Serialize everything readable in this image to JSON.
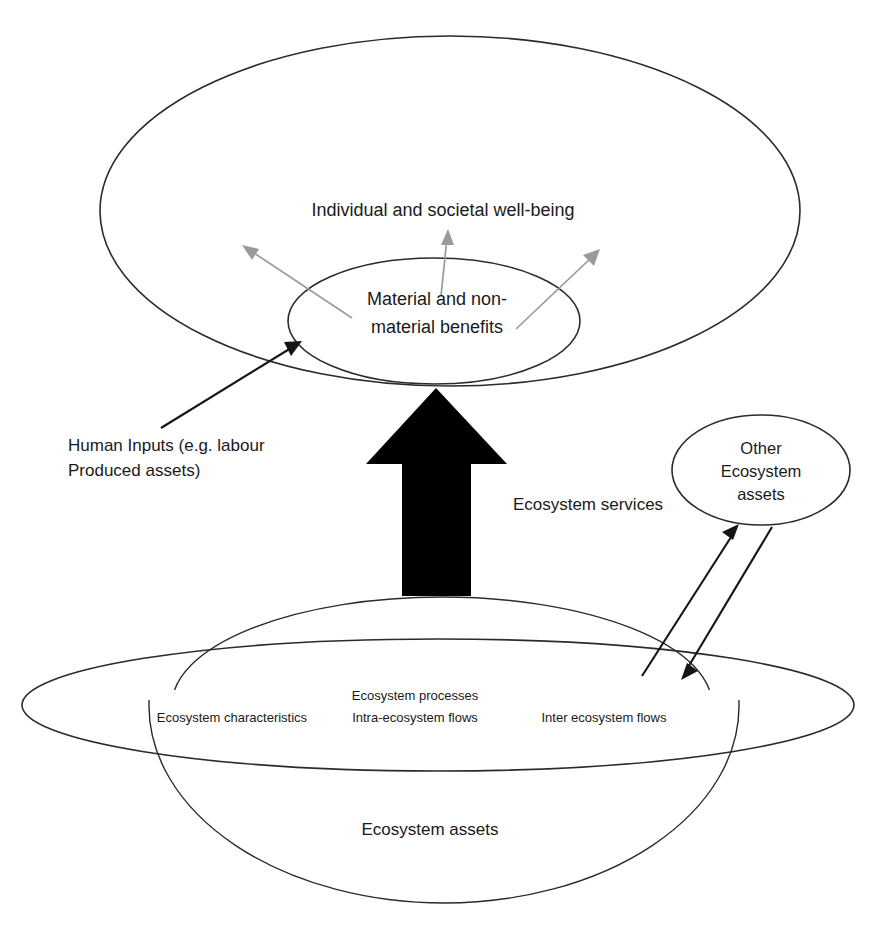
{
  "diagram": {
    "type": "concept-diagram",
    "background_color": "#ffffff",
    "outline_color": "#2b2b2b",
    "grey_arrow_color": "#9a9a9a",
    "black_arrow_color": "#141414",
    "block_arrow_color": "#000000",
    "labels": {
      "wellbeing": "Individual and societal well-being",
      "benefits_line1": "Material and non-",
      "benefits_line2": "material benefits",
      "human_inputs_line1": "Human Inputs (e.g. labour",
      "human_inputs_line2": "Produced assets)",
      "ecosystem_services": "Ecosystem services",
      "other_ecosystem_line1": "Other",
      "other_ecosystem_line2": "Ecosystem",
      "other_ecosystem_line3": "assets",
      "ecosystem_characteristics": "Ecosystem characteristics",
      "ecosystem_processes": "Ecosystem processes",
      "intra_ecosystem_flows": "Intra-ecosystem flows",
      "inter_ecosystem_flows": "Inter ecosystem flows",
      "ecosystem_assets": "Ecosystem assets"
    },
    "shapes": {
      "outer_wellbeing_ellipse": "large ellipse enclosing well-being domain",
      "inner_benefits_ellipse": "small ellipse for material and non-material benefits",
      "other_assets_ellipse": "small ellipse for other ecosystem assets",
      "ecosystem_disc_ellipse": "large flat ellipse representing the ecosystem asset disc",
      "ecosystem_dome": "upper dome cap of the ecosystem asset body",
      "ecosystem_bowl": "lower bowl of the ecosystem asset body"
    },
    "arrows": {
      "block_arrow_up": "thick black block arrow carrying ecosystem services upward",
      "grey_benefit_left": "grey arrow radiating up-left from benefits",
      "grey_benefit_centre": "grey arrow radiating up from benefits",
      "grey_benefit_right": "grey arrow radiating up-right from benefits",
      "human_inputs_arrow": "black arrow from human inputs label into benefits ellipse",
      "inter_flow_up": "black arrow from ecosystem disc up to other ecosystem assets",
      "inter_flow_down": "black arrow from other ecosystem assets down to ecosystem disc"
    }
  }
}
